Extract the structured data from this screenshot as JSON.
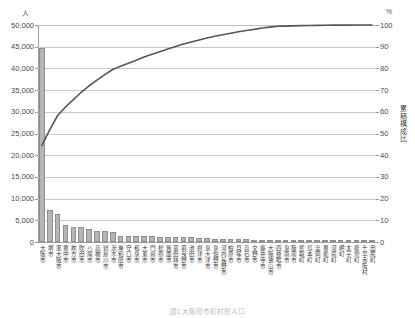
{
  "axes": {
    "left_unit": "人",
    "right_unit": "%",
    "right_axis_title": "累積構成比",
    "left_ticks": [
      "50,000",
      "45,000",
      "40,000",
      "35,000",
      "30,000",
      "25,000",
      "20,000",
      "15,000",
      "10,000",
      "5,000",
      "0"
    ],
    "right_ticks": [
      "100",
      "90",
      "80",
      "70",
      "60",
      "50",
      "40",
      "30",
      "20",
      "10",
      "0"
    ]
  },
  "caption": "図1 大阪府市町村別人口",
  "chart_data": {
    "type": "bar",
    "title": "",
    "subtitle": "",
    "xlabel": "",
    "ylabel": "人",
    "ylim": [
      0,
      50000
    ],
    "y2label": "累積構成比",
    "y2lim": [
      0,
      100
    ],
    "grid": true,
    "legend_position": "none",
    "categories": [
      "大阪市",
      "堺市",
      "東大阪市",
      "豊中市",
      "枚方市",
      "吹田市",
      "八尾市",
      "高槻市",
      "寝屋川市",
      "茨木市",
      "岸和田市",
      "守口市",
      "和泉市",
      "大東市",
      "門真市",
      "松原市",
      "箕面市",
      "富田林市",
      "羽曳野市",
      "池田市",
      "摂津市",
      "泉大津市",
      "泉佐野市",
      "河内長野市",
      "柏原市",
      "貝塚市",
      "高石市",
      "交野市",
      "藤井寺市",
      "大阪狭山市",
      "四條畷市",
      "泉南市",
      "阪南市",
      "熊取町",
      "島本町",
      "忠岡町",
      "豊能町",
      "河南町",
      "岬町",
      "太子町",
      "能勢町",
      "千早赤阪村",
      "田尻町"
    ],
    "series": [
      {
        "name": "人口",
        "type": "bar",
        "values": [
          44700,
          7300,
          6500,
          3900,
          3400,
          3350,
          3050,
          2600,
          2450,
          2400,
          1500,
          1450,
          1400,
          1350,
          1300,
          1250,
          1200,
          1150,
          1100,
          1050,
          900,
          850,
          800,
          750,
          700,
          650,
          600,
          560,
          520,
          480,
          440,
          400,
          360,
          300,
          240,
          200,
          170,
          140,
          120,
          100,
          85,
          45,
          35
        ]
      },
      {
        "name": "累積構成比",
        "type": "line",
        "axis": "y2",
        "values": [
          44.5,
          51.8,
          58.3,
          62.2,
          65.6,
          69.0,
          72.0,
          74.6,
          77.1,
          79.5,
          81.0,
          82.4,
          83.8,
          85.2,
          86.5,
          87.7,
          88.9,
          90.1,
          91.2,
          92.2,
          93.1,
          94.0,
          94.8,
          95.5,
          96.2,
          96.9,
          97.5,
          98.0,
          98.6,
          99.0,
          99.4,
          99.5,
          99.6,
          99.7,
          99.8,
          99.85,
          99.9,
          99.92,
          99.94,
          99.96,
          99.98,
          99.99,
          100.0
        ]
      }
    ]
  }
}
